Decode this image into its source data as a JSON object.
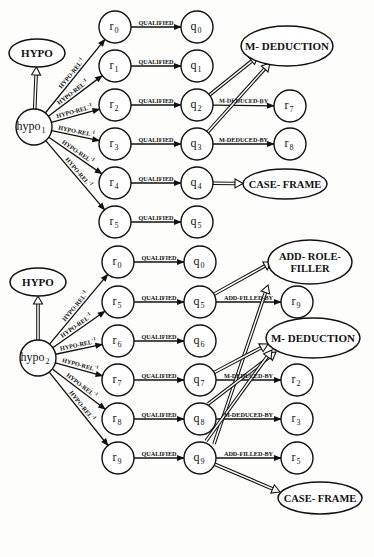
{
  "diagram": {
    "type": "semantic-network",
    "colors": {
      "ink": "#111111",
      "background": "#fdfdfc"
    },
    "panels": [
      {
        "id": "top",
        "class_nodes": [
          {
            "id": "hypo_class_1",
            "label": "HYPO",
            "cx": 37,
            "cy": 53,
            "rx": 28,
            "ry": 14,
            "fs": 11
          },
          {
            "id": "mded_class_1",
            "label": "M- DEDUCTION",
            "cx": 287,
            "cy": 46,
            "rx": 46,
            "ry": 20,
            "fs": 11
          },
          {
            "id": "cf_class_1",
            "label": "CASE- FRAME",
            "cx": 285,
            "cy": 184,
            "rx": 42,
            "ry": 15,
            "fs": 10.5
          }
        ],
        "root": {
          "id": "hypo1",
          "base": "hypo",
          "sub": "1",
          "cx": 34,
          "cy": 127,
          "r": 18
        },
        "r_nodes": [
          {
            "id": "t_r0",
            "base": "r",
            "sub": "0",
            "cx": 115,
            "cy": 27
          },
          {
            "id": "t_r1",
            "base": "r",
            "sub": "1",
            "cx": 115,
            "cy": 66
          },
          {
            "id": "t_r2",
            "base": "r",
            "sub": "2",
            "cx": 115,
            "cy": 105
          },
          {
            "id": "t_r3",
            "base": "r",
            "sub": "3",
            "cx": 115,
            "cy": 144
          },
          {
            "id": "t_r4",
            "base": "r",
            "sub": "4",
            "cx": 115,
            "cy": 183
          },
          {
            "id": "t_r5",
            "base": "r",
            "sub": "5",
            "cx": 115,
            "cy": 222
          }
        ],
        "q_nodes": [
          {
            "id": "t_q0",
            "base": "q",
            "sub": "0",
            "cx": 197,
            "cy": 27
          },
          {
            "id": "t_q1",
            "base": "q",
            "sub": "1",
            "cx": 197,
            "cy": 66
          },
          {
            "id": "t_q2",
            "base": "q",
            "sub": "2",
            "cx": 197,
            "cy": 105
          },
          {
            "id": "t_q3",
            "base": "q",
            "sub": "3",
            "cx": 197,
            "cy": 144
          },
          {
            "id": "t_q4",
            "base": "q",
            "sub": "4",
            "cx": 197,
            "cy": 183
          },
          {
            "id": "t_q5",
            "base": "q",
            "sub": "5",
            "cx": 197,
            "cy": 222
          }
        ],
        "extra_nodes": [
          {
            "id": "t_r7",
            "base": "r",
            "sub": "7",
            "cx": 290,
            "cy": 106
          },
          {
            "id": "t_r8",
            "base": "r",
            "sub": "8",
            "cx": 290,
            "cy": 144
          }
        ],
        "hypo_rel_label": "HYPO-REL",
        "hypo_rel_sup": "-1",
        "qualified_label": "QUALIFIED",
        "side_edges": [
          {
            "from": "t_q2",
            "to": "t_r7",
            "label": "M-DEDUCED-BY"
          },
          {
            "from": "t_q3",
            "to": "t_r8",
            "label": "M-DEDUCED-BY"
          }
        ],
        "isa_edges": [
          {
            "from": "hypo1",
            "to": "hypo_class_1"
          },
          {
            "from": "t_q2",
            "to": "mded_class_1",
            "tx": 258,
            "ty": 56
          },
          {
            "from": "t_q3",
            "to": "mded_class_1",
            "tx": 270,
            "ty": 63
          },
          {
            "from": "t_q4",
            "to": "cf_class_1"
          }
        ]
      },
      {
        "id": "bottom",
        "class_nodes": [
          {
            "id": "hypo_class_2",
            "label": "HYPO",
            "cx": 38,
            "cy": 282,
            "rx": 28,
            "ry": 14,
            "fs": 11
          },
          {
            "id": "arf_class_2",
            "label": "ADD- ROLE-",
            "label2": "FILLER",
            "cx": 310,
            "cy": 262,
            "rx": 42,
            "ry": 22,
            "fs": 10.5
          },
          {
            "id": "mded_class_2",
            "label": "M- DEDUCTION",
            "cx": 313,
            "cy": 338,
            "rx": 47,
            "ry": 20,
            "fs": 11
          },
          {
            "id": "cf_class_2",
            "label": "CASE- FRAME",
            "cx": 320,
            "cy": 498,
            "rx": 42,
            "ry": 16,
            "fs": 10.5
          }
        ],
        "root": {
          "id": "hypo2",
          "base": "hypo",
          "sub": "2",
          "cx": 38,
          "cy": 358,
          "r": 18
        },
        "r_nodes": [
          {
            "id": "b_r0",
            "base": "r",
            "sub": "0",
            "cx": 118,
            "cy": 262
          },
          {
            "id": "b_r5",
            "base": "r",
            "sub": "5",
            "cx": 118,
            "cy": 302
          },
          {
            "id": "b_r6",
            "base": "r",
            "sub": "6",
            "cx": 118,
            "cy": 341
          },
          {
            "id": "b_r7",
            "base": "r",
            "sub": "7",
            "cx": 118,
            "cy": 380
          },
          {
            "id": "b_r8",
            "base": "r",
            "sub": "8",
            "cx": 118,
            "cy": 419
          },
          {
            "id": "b_r9",
            "base": "r",
            "sub": "9",
            "cx": 118,
            "cy": 458
          }
        ],
        "q_nodes": [
          {
            "id": "b_q0",
            "base": "q",
            "sub": "0",
            "cx": 200,
            "cy": 262
          },
          {
            "id": "b_q5",
            "base": "q",
            "sub": "5",
            "cx": 200,
            "cy": 302
          },
          {
            "id": "b_q6",
            "base": "q",
            "sub": "6",
            "cx": 200,
            "cy": 341
          },
          {
            "id": "b_q7",
            "base": "q",
            "sub": "7",
            "cx": 200,
            "cy": 380
          },
          {
            "id": "b_q8",
            "base": "q",
            "sub": "8",
            "cx": 200,
            "cy": 419
          },
          {
            "id": "b_q9",
            "base": "q",
            "sub": "9",
            "cx": 200,
            "cy": 458
          }
        ],
        "extra_nodes": [
          {
            "id": "b_r9x",
            "base": "r",
            "sub": "9",
            "cx": 297,
            "cy": 302
          },
          {
            "id": "b_r2x",
            "base": "r",
            "sub": "2",
            "cx": 297,
            "cy": 380
          },
          {
            "id": "b_r3x",
            "base": "r",
            "sub": "3",
            "cx": 297,
            "cy": 419
          },
          {
            "id": "b_r5x",
            "base": "r",
            "sub": "5",
            "cx": 297,
            "cy": 458
          }
        ],
        "hypo_rel_label": "HYPO-REL",
        "hypo_rel_sup": "-1",
        "qualified_label": "QUALIFIED",
        "side_edges": [
          {
            "from": "b_q5",
            "to": "b_r9x",
            "label": "ADD-FILLED-BY"
          },
          {
            "from": "b_q7",
            "to": "b_r2x",
            "label": "M-DEDUCED-BY"
          },
          {
            "from": "b_q8",
            "to": "b_r3x",
            "label": "M-DEDUCED-BY"
          },
          {
            "from": "b_q9",
            "to": "b_r5x",
            "label": "ADD-FILLED-BY"
          }
        ],
        "isa_edges": [
          {
            "from": "hypo2",
            "to": "hypo_class_2"
          },
          {
            "from": "b_q5",
            "to": "arf_class_2",
            "tx": 272,
            "ty": 262
          },
          {
            "from": "b_q9",
            "to": "arf_class_2",
            "tx": 268,
            "ty": 285,
            "fx": 214,
            "fy": 444
          },
          {
            "from": "b_q7",
            "to": "mded_class_2",
            "tx": 268,
            "ty": 344
          },
          {
            "from": "b_q8",
            "to": "mded_class_2",
            "tx": 276,
            "ty": 352,
            "fx": 208,
            "fy": 404
          },
          {
            "from": "b_q9",
            "to": "mded_class_2",
            "tx": 272,
            "ty": 350,
            "fx": 206,
            "fy": 441
          },
          {
            "from": "b_q9",
            "to": "cf_class_2",
            "tx": 280,
            "ty": 492
          }
        ]
      }
    ]
  }
}
